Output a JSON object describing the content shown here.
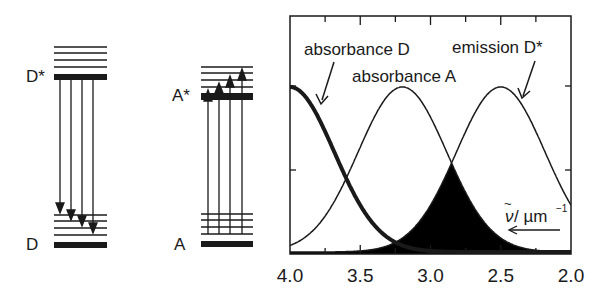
{
  "diagrams": {
    "donor": {
      "excited_label": "D*",
      "ground_label": "D"
    },
    "acceptor": {
      "excited_label": "A*",
      "ground_label": "A"
    }
  },
  "labels": {
    "absorbance_d": "absorbance D",
    "absorbance_a": "absorbance A",
    "emission_d": "emission D*",
    "axis_unit": "/ µm",
    "axis_exponent": "−1",
    "axis_symbol": "ν"
  },
  "colors": {
    "ink": "#1a1a1a",
    "background": "#ffffff"
  },
  "chart_data": {
    "type": "line",
    "title": "",
    "xlabel": "ν̃ / µm⁻¹",
    "ylabel": "",
    "xlim": [
      4.0,
      2.0
    ],
    "x_reversed": true,
    "x_ticks": [
      "4.0",
      "3.5",
      "3.0",
      "2.5",
      "2.0"
    ],
    "grid": false,
    "series": [
      {
        "name": "absorbance D",
        "shape": "gaussian",
        "center": 4.0,
        "sigma": 0.315,
        "amplitude": 1.0,
        "style": "thick"
      },
      {
        "name": "absorbance A",
        "shape": "gaussian",
        "center": 3.2,
        "sigma": 0.315,
        "amplitude": 1.0,
        "style": "thin"
      },
      {
        "name": "emission D*",
        "shape": "gaussian",
        "center": 2.5,
        "sigma": 0.315,
        "amplitude": 1.0,
        "style": "thin"
      }
    ],
    "shaded_overlap": {
      "between": [
        "absorbance A",
        "emission D*"
      ],
      "crossing_x": 2.85,
      "fill": "#000000"
    },
    "annotations": [
      {
        "text": "absorbance D",
        "arrow_to": "absorbance D curve"
      },
      {
        "text": "absorbance A"
      },
      {
        "text": "emission D*",
        "arrow_to": "emission D* curve"
      },
      {
        "text": "ν̃ / µm⁻¹",
        "arrow": "leftward (increasing wavenumber)"
      }
    ]
  }
}
